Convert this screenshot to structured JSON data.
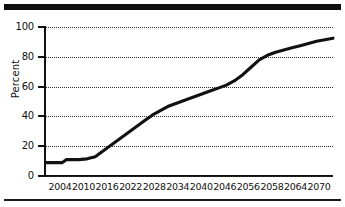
{
  "figure": {
    "background_color": "#ffffff",
    "line_color": "#111111",
    "grid_color": "#2b2b2b",
    "rule_color": "#0d0d0d"
  },
  "axis": {
    "ylabel": "Percent",
    "yticks": [
      "0",
      "20",
      "40",
      "60",
      "80",
      "100"
    ],
    "xticks": [
      "2004",
      "2010",
      "2016",
      "2022",
      "2028",
      "2034",
      "2040",
      "2046",
      "2056",
      "2058",
      "2064",
      "2070"
    ]
  },
  "chart_data": {
    "type": "line",
    "title": "",
    "subtitle": "",
    "xlabel": "",
    "ylabel": "Percent",
    "xlim": [
      2004,
      2074
    ],
    "ylim": [
      0,
      100
    ],
    "grid": "horizontal-dotted",
    "legend": "none",
    "tick_labels": {
      "x": [
        "2004",
        "2010",
        "2016",
        "2022",
        "2028",
        "2034",
        "2040",
        "2046",
        "2056",
        "2058",
        "2064",
        "2070"
      ],
      "y": [
        "0",
        "20",
        "40",
        "60",
        "80",
        "100"
      ]
    },
    "series": [
      {
        "name": "Percent",
        "color": "#111111",
        "x": [
          2004,
          2006,
          2008,
          2009,
          2010,
          2012,
          2014,
          2016,
          2018,
          2020,
          2022,
          2024,
          2026,
          2028,
          2030,
          2032,
          2034,
          2036,
          2038,
          2040,
          2042,
          2044,
          2046,
          2048,
          2050,
          2052,
          2054,
          2056,
          2058,
          2060,
          2062,
          2064,
          2066,
          2068,
          2070,
          2072,
          2074
        ],
        "values": [
          9,
          9,
          9,
          11,
          11,
          11,
          11.5,
          13,
          17,
          21,
          25,
          29,
          33,
          37,
          41,
          44,
          47,
          49,
          51,
          53,
          55,
          57,
          59,
          61,
          64,
          68,
          73,
          78,
          81,
          83,
          84.5,
          86,
          87.5,
          89,
          90.5,
          91.5,
          92.5
        ]
      }
    ],
    "annotations": []
  }
}
